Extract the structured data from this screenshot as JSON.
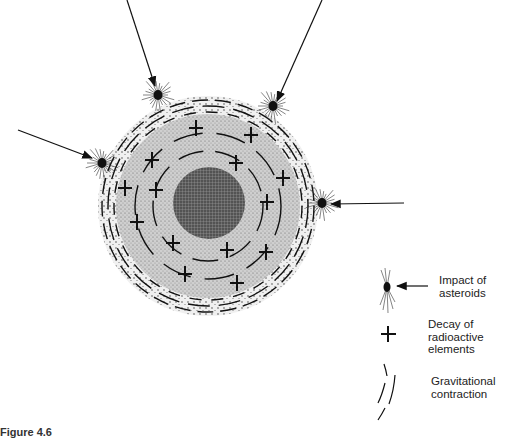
{
  "diagram": {
    "center": [
      208,
      206
    ],
    "outer_radius": 108,
    "core_radius": 36,
    "colors": {
      "ink": "#111111",
      "mantle": "#c9c9c9",
      "core": "#5a5a5a",
      "shell": "#e6e6e6"
    },
    "impact_arrows": [
      {
        "from": [
          127,
          0
        ],
        "to": [
          155,
          86
        ],
        "dot": [
          158,
          95
        ]
      },
      {
        "from": [
          322,
          0
        ],
        "to": [
          277,
          101
        ],
        "dot": [
          273,
          106
        ]
      },
      {
        "from": [
          18,
          130
        ],
        "to": [
          92,
          158
        ],
        "dot": [
          102,
          163
        ]
      },
      {
        "from": [
          404,
          203
        ],
        "to": [
          331,
          204
        ],
        "dot": [
          322,
          203
        ]
      }
    ],
    "crosses": [
      [
        196,
        128
      ],
      [
        251,
        135
      ],
      [
        152,
        160
      ],
      [
        236,
        163
      ],
      [
        125,
        188
      ],
      [
        156,
        190
      ],
      [
        283,
        178
      ],
      [
        267,
        202
      ],
      [
        137,
        222
      ],
      [
        173,
        243
      ],
      [
        227,
        250
      ],
      [
        266,
        252
      ],
      [
        185,
        274
      ],
      [
        237,
        283
      ]
    ]
  },
  "legend": {
    "items": [
      {
        "symbol": "impact-icon",
        "lines": [
          "Impact of",
          "asteroids"
        ]
      },
      {
        "symbol": "cross-icon",
        "lines": [
          "Decay of",
          "radioactive",
          "elements"
        ]
      },
      {
        "symbol": "arc-lines-icon",
        "lines": [
          "Gravitational",
          "contraction"
        ]
      }
    ]
  },
  "caption": "Figure 4.6"
}
